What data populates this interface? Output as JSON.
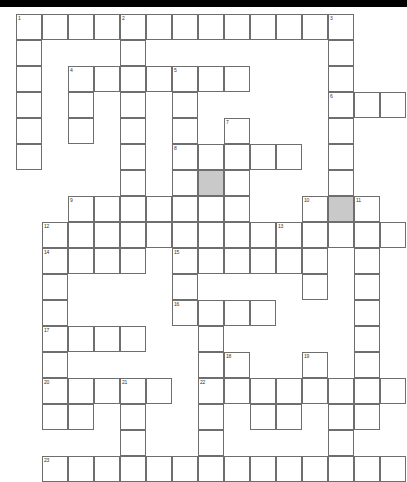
{
  "puzzle": {
    "type": "crossword-grid",
    "title": "",
    "grid": {
      "origin_x": 16,
      "origin_y": 7,
      "cell_size": 26,
      "columns": 14,
      "rows": 17
    },
    "colors": {
      "cell_background": "#ffffff",
      "cell_border": "#6e6e6e",
      "shaded_cell": "#c9c9c9",
      "number_text": "#333333",
      "topbar": "#000000"
    },
    "clue_numbers": [
      1,
      2,
      3,
      4,
      5,
      6,
      7,
      8,
      9,
      10,
      11,
      12,
      13,
      14,
      15,
      16,
      17,
      18,
      19,
      20,
      21,
      22,
      23
    ],
    "cells": [
      {
        "c": 0,
        "r": 0,
        "n": "1"
      },
      {
        "c": 1,
        "r": 0
      },
      {
        "c": 2,
        "r": 0
      },
      {
        "c": 3,
        "r": 0
      },
      {
        "c": 4,
        "r": 0,
        "n": "2"
      },
      {
        "c": 5,
        "r": 0
      },
      {
        "c": 6,
        "r": 0
      },
      {
        "c": 7,
        "r": 0
      },
      {
        "c": 8,
        "r": 0
      },
      {
        "c": 9,
        "r": 0
      },
      {
        "c": 10,
        "r": 0
      },
      {
        "c": 11,
        "r": 0
      },
      {
        "c": 12,
        "r": 0,
        "n": "3"
      },
      {
        "c": 0,
        "r": 1
      },
      {
        "c": 4,
        "r": 1
      },
      {
        "c": 12,
        "r": 1
      },
      {
        "c": 0,
        "r": 2
      },
      {
        "c": 2,
        "r": 2,
        "n": "4"
      },
      {
        "c": 3,
        "r": 2
      },
      {
        "c": 4,
        "r": 2
      },
      {
        "c": 5,
        "r": 2
      },
      {
        "c": 6,
        "r": 2,
        "n": "5"
      },
      {
        "c": 7,
        "r": 2
      },
      {
        "c": 8,
        "r": 2
      },
      {
        "c": 12,
        "r": 2
      },
      {
        "c": 0,
        "r": 3
      },
      {
        "c": 2,
        "r": 3
      },
      {
        "c": 4,
        "r": 3
      },
      {
        "c": 6,
        "r": 3
      },
      {
        "c": 12,
        "r": 3,
        "n": "6"
      },
      {
        "c": 13,
        "r": 3
      },
      {
        "c": 14,
        "r": 3
      },
      {
        "c": 0,
        "r": 4
      },
      {
        "c": 2,
        "r": 4
      },
      {
        "c": 4,
        "r": 4
      },
      {
        "c": 6,
        "r": 4
      },
      {
        "c": 8,
        "r": 4,
        "n": "7"
      },
      {
        "c": 12,
        "r": 4
      },
      {
        "c": 0,
        "r": 5
      },
      {
        "c": 4,
        "r": 5
      },
      {
        "c": 6,
        "r": 5,
        "n": "8"
      },
      {
        "c": 7,
        "r": 5
      },
      {
        "c": 8,
        "r": 5
      },
      {
        "c": 9,
        "r": 5
      },
      {
        "c": 10,
        "r": 5
      },
      {
        "c": 12,
        "r": 5
      },
      {
        "c": 4,
        "r": 6
      },
      {
        "c": 6,
        "r": 6
      },
      {
        "c": 7,
        "r": 6,
        "s": true
      },
      {
        "c": 8,
        "r": 6
      },
      {
        "c": 12,
        "r": 6
      },
      {
        "c": 2,
        "r": 7,
        "n": "9"
      },
      {
        "c": 3,
        "r": 7
      },
      {
        "c": 4,
        "r": 7
      },
      {
        "c": 5,
        "r": 7
      },
      {
        "c": 6,
        "r": 7
      },
      {
        "c": 7,
        "r": 7
      },
      {
        "c": 8,
        "r": 7
      },
      {
        "c": 11,
        "r": 7,
        "n": "10"
      },
      {
        "c": 12,
        "r": 7,
        "s": true
      },
      {
        "c": 13,
        "r": 7,
        "n": "11"
      },
      {
        "c": 1,
        "r": 8,
        "n": "12"
      },
      {
        "c": 2,
        "r": 8
      },
      {
        "c": 3,
        "r": 8
      },
      {
        "c": 4,
        "r": 8
      },
      {
        "c": 5,
        "r": 8
      },
      {
        "c": 6,
        "r": 8
      },
      {
        "c": 7,
        "r": 8
      },
      {
        "c": 8,
        "r": 8
      },
      {
        "c": 9,
        "r": 8
      },
      {
        "c": 10,
        "r": 8,
        "n": "13"
      },
      {
        "c": 11,
        "r": 8
      },
      {
        "c": 12,
        "r": 8
      },
      {
        "c": 13,
        "r": 8
      },
      {
        "c": 14,
        "r": 8
      },
      {
        "c": 1,
        "r": 9,
        "n": "14"
      },
      {
        "c": 2,
        "r": 9
      },
      {
        "c": 3,
        "r": 9
      },
      {
        "c": 4,
        "r": 9
      },
      {
        "c": 6,
        "r": 9,
        "n": "15"
      },
      {
        "c": 7,
        "r": 9
      },
      {
        "c": 8,
        "r": 9
      },
      {
        "c": 9,
        "r": 9
      },
      {
        "c": 10,
        "r": 9
      },
      {
        "c": 11,
        "r": 9
      },
      {
        "c": 13,
        "r": 9
      },
      {
        "c": 1,
        "r": 10
      },
      {
        "c": 6,
        "r": 10
      },
      {
        "c": 11,
        "r": 10
      },
      {
        "c": 13,
        "r": 10
      },
      {
        "c": 1,
        "r": 11
      },
      {
        "c": 6,
        "r": 11,
        "n": "16"
      },
      {
        "c": 7,
        "r": 11
      },
      {
        "c": 8,
        "r": 11
      },
      {
        "c": 9,
        "r": 11
      },
      {
        "c": 13,
        "r": 11
      },
      {
        "c": 1,
        "r": 12,
        "n": "17"
      },
      {
        "c": 2,
        "r": 12
      },
      {
        "c": 3,
        "r": 12
      },
      {
        "c": 4,
        "r": 12
      },
      {
        "c": 7,
        "r": 12
      },
      {
        "c": 13,
        "r": 12
      },
      {
        "c": 1,
        "r": 13
      },
      {
        "c": 7,
        "r": 13
      },
      {
        "c": 8,
        "r": 13,
        "n": "18"
      },
      {
        "c": 11,
        "r": 13,
        "n": "19"
      },
      {
        "c": 13,
        "r": 13
      },
      {
        "c": 1,
        "r": 14,
        "n": "20"
      },
      {
        "c": 2,
        "r": 14
      },
      {
        "c": 3,
        "r": 14
      },
      {
        "c": 4,
        "r": 14,
        "n": "21"
      },
      {
        "c": 5,
        "r": 14
      },
      {
        "c": 7,
        "r": 14,
        "n": "22"
      },
      {
        "c": 8,
        "r": 14
      },
      {
        "c": 9,
        "r": 14
      },
      {
        "c": 10,
        "r": 14
      },
      {
        "c": 11,
        "r": 14
      },
      {
        "c": 12,
        "r": 14
      },
      {
        "c": 13,
        "r": 14
      },
      {
        "c": 14,
        "r": 14
      },
      {
        "c": 1,
        "r": 15
      },
      {
        "c": 2,
        "r": 15
      },
      {
        "c": 4,
        "r": 15
      },
      {
        "c": 7,
        "r": 15
      },
      {
        "c": 9,
        "r": 15
      },
      {
        "c": 10,
        "r": 15
      },
      {
        "c": 12,
        "r": 15
      },
      {
        "c": 13,
        "r": 15
      },
      {
        "c": 4,
        "r": 16
      },
      {
        "c": 7,
        "r": 16
      },
      {
        "c": 12,
        "r": 16
      },
      {
        "c": 1,
        "r": 17,
        "n": "23"
      },
      {
        "c": 2,
        "r": 17
      },
      {
        "c": 3,
        "r": 17
      },
      {
        "c": 4,
        "r": 17
      },
      {
        "c": 5,
        "r": 17
      },
      {
        "c": 6,
        "r": 17
      },
      {
        "c": 7,
        "r": 17
      },
      {
        "c": 8,
        "r": 17
      },
      {
        "c": 9,
        "r": 17
      },
      {
        "c": 10,
        "r": 17
      },
      {
        "c": 11,
        "r": 17
      },
      {
        "c": 12,
        "r": 17
      },
      {
        "c": 13,
        "r": 17
      },
      {
        "c": 14,
        "r": 17
      }
    ]
  }
}
